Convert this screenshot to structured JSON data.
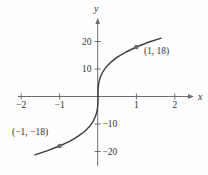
{
  "chart_data": {
    "type": "line",
    "title": "",
    "x_axis_label": "x",
    "y_axis_label": "y",
    "grid": false,
    "legend": false,
    "xlim": [
      -2.1,
      2.5
    ],
    "ylim": [
      -27,
      28.5
    ],
    "x_ticks": [
      {
        "value": -2,
        "label": "−2"
      },
      {
        "value": -1,
        "label": "−1"
      },
      {
        "value": 1,
        "label": "1"
      },
      {
        "value": 2,
        "label": "2"
      }
    ],
    "y_ticks": [
      {
        "value": 20,
        "label": "20"
      },
      {
        "value": 10,
        "label": "10"
      },
      {
        "value": -10,
        "label": "−10"
      },
      {
        "value": -20,
        "label": "−20"
      }
    ],
    "curve_points": [
      [
        -1.643,
        -21.2
      ],
      [
        -1.331,
        -19.8
      ],
      [
        -1.0,
        -18.0
      ],
      [
        -0.729,
        -16.2
      ],
      [
        -0.512,
        -14.4
      ],
      [
        -0.343,
        -12.6
      ],
      [
        -0.216,
        -10.8
      ],
      [
        -0.125,
        -9.0
      ],
      [
        -0.064,
        -7.2
      ],
      [
        -0.027,
        -5.4
      ],
      [
        -0.008,
        -3.6
      ],
      [
        -0.001,
        -1.8
      ],
      [
        0,
        0
      ],
      [
        0.001,
        1.8
      ],
      [
        0.008,
        3.6
      ],
      [
        0.027,
        5.4
      ],
      [
        0.064,
        7.2
      ],
      [
        0.125,
        9.0
      ],
      [
        0.216,
        10.8
      ],
      [
        0.343,
        12.6
      ],
      [
        0.512,
        14.4
      ],
      [
        0.729,
        16.2
      ],
      [
        1.0,
        18.0
      ],
      [
        1.331,
        19.8
      ],
      [
        1.643,
        21.2
      ]
    ],
    "marked_points": [
      {
        "x": 1,
        "y": 18,
        "label": "(1, 18)"
      },
      {
        "x": -1,
        "y": -18,
        "label": "(−1, −18)"
      }
    ]
  },
  "colors": {
    "curve": "#3d3d3d",
    "axis": "#6e6e6e",
    "tick": "#6e6e6e",
    "point": "#6b6b6b",
    "text": "#2f2f2f",
    "background": "#fefefe"
  }
}
